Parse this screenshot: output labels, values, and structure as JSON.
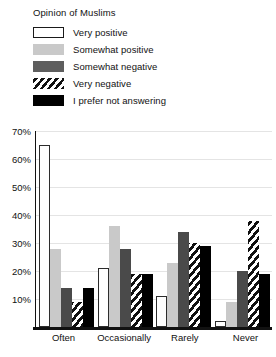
{
  "chart_data": {
    "type": "bar",
    "title": "Opinion of Muslims",
    "xlabel": "",
    "ylabel": "",
    "ylim": [
      0,
      70
    ],
    "grid": true,
    "legend_position": "top",
    "categories": [
      "Often",
      "Occasionally",
      "Rarely",
      "Never"
    ],
    "ytick_labels": [
      "70%",
      "60%",
      "50%",
      "40%",
      "30%",
      "20%",
      "10%"
    ],
    "ytick_values": [
      70,
      60,
      50,
      40,
      30,
      20,
      10
    ],
    "series": [
      {
        "name": "Very positive",
        "swatch": "verypos",
        "color": "#ffffff",
        "values": [
          65,
          21,
          11,
          2
        ]
      },
      {
        "name": "Somewhat positive",
        "swatch": "somepos",
        "color": "#c9c9c9",
        "values": [
          28,
          36,
          23,
          9
        ]
      },
      {
        "name": "Somewhat negative",
        "swatch": "someneg",
        "color": "#5e5e5e",
        "values": [
          14,
          28,
          34,
          20
        ]
      },
      {
        "name": "Very negative",
        "swatch": "veryneg",
        "color": "#111111",
        "values": [
          9,
          19,
          30,
          38
        ]
      },
      {
        "name": "I prefer not answering",
        "swatch": "nopref",
        "color": "#000000",
        "values": [
          14,
          19,
          29,
          19
        ]
      }
    ]
  },
  "legend": {
    "title": "Opinion of Muslims",
    "items": [
      {
        "label": "Very positive"
      },
      {
        "label": "Somewhat positive"
      },
      {
        "label": "Somewhat negative"
      },
      {
        "label": "Very negative"
      },
      {
        "label": "I prefer not answering"
      }
    ]
  }
}
